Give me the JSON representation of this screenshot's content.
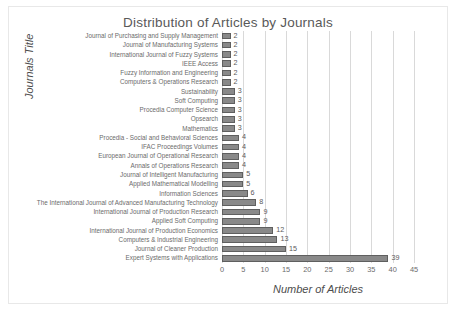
{
  "chart_data": {
    "type": "bar",
    "orientation": "horizontal",
    "title": "Distribution of Articles by Journals",
    "xlabel": "Number of Articles",
    "ylabel": "Journals Title",
    "xlim": [
      0,
      45
    ],
    "xticks": [
      0,
      5,
      10,
      15,
      20,
      25,
      30,
      35,
      40,
      45
    ],
    "grid": "vertical",
    "legend": "none",
    "bar_color": "#898989",
    "bar_border_color": "#5f5f5f",
    "gridline_color": "#d9d9d9",
    "text_color": "#595959",
    "categories": [
      "Journal of Purchasing and Supply Management",
      "Journal of Manufacturing Systems",
      "International Journal of Fuzzy Systems",
      "IEEE Access",
      "Fuzzy Information and Engineering",
      "Computers & Operations Research",
      "Sustainability",
      "Soft Computing",
      "Procedia Computer Science",
      "Opsearch",
      "Mathematics",
      "Procedia - Social and Behavioral Sciences",
      "IFAC Proceedings Volumes",
      "European Journal of Operational Research",
      "Annals of Operations Research",
      "Journal of Intelligent Manufacturing",
      "Applied Mathematical Modelling",
      "Information Sciences",
      "The International Journal of Advanced Manufacturing Technology",
      "International Journal of Production Research",
      "Applied Soft Computing",
      "International Journal of Production Economics",
      "Computers & Industrial Engineering",
      "Journal of Cleaner Production",
      "Expert Systems with Applications"
    ],
    "values": [
      2,
      2,
      2,
      2,
      2,
      2,
      3,
      3,
      3,
      3,
      3,
      4,
      4,
      4,
      4,
      5,
      5,
      6,
      8,
      9,
      9,
      12,
      13,
      15,
      39
    ]
  }
}
